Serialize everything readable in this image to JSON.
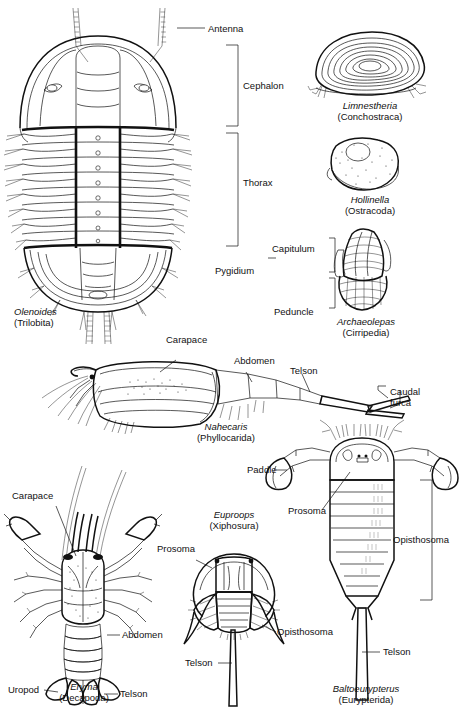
{
  "plate": {
    "title": "Fossil arthropod morphology plate",
    "specimens": [
      {
        "id": "olenoides",
        "genus": "Olenoides",
        "group": "(Trilobita)",
        "labels": [
          "Antenna",
          "Cephalon",
          "Thorax",
          "Pygidium"
        ]
      },
      {
        "id": "limnestheria",
        "genus": "Limnestheria",
        "group": "(Conchostraca)",
        "labels": []
      },
      {
        "id": "hollinella",
        "genus": "Hollinella",
        "group": "(Ostracoda)",
        "labels": []
      },
      {
        "id": "archaeolepas",
        "genus": "Archaeolepas",
        "group": "(Cirripedia)",
        "labels": [
          "Capitulum",
          "Peduncle"
        ]
      },
      {
        "id": "nahecaris",
        "genus": "Nahecaris",
        "group": "(Phyllocarida)",
        "labels": [
          "Carapace",
          "Abdomen",
          "Telson",
          "Caudal",
          "furca"
        ]
      },
      {
        "id": "eryma",
        "genus": "Eryma",
        "group": "(Decapoda)",
        "labels": [
          "Carapace",
          "Abdomen",
          "Uropod",
          "Telson"
        ]
      },
      {
        "id": "euproops",
        "genus": "Euproops",
        "group": "(Xiphosura)",
        "labels": [
          "Prosoma",
          "Opisthosoma",
          "Telson"
        ]
      },
      {
        "id": "baltoeurypterus",
        "genus": "Baltoeurypterus",
        "group": "(Eurypterida)",
        "labels": [
          "Paddle",
          "Prosoma",
          "Opisthosoma",
          "Telson"
        ]
      }
    ]
  },
  "labels": {
    "antenna": "Antenna",
    "cephalon": "Cephalon",
    "thorax": "Thorax",
    "pygidium": "Pygidium",
    "capitulum": "Capitulum",
    "peduncle": "Peduncle",
    "carapace_nahecaris": "Carapace",
    "abdomen_nahecaris": "Abdomen",
    "telson_nahecaris": "Telson",
    "caudal_furca": "Caudal\nfurca",
    "carapace_eryma": "Carapace",
    "abdomen_eryma": "Abdomen",
    "uropod_eryma": "Uropod",
    "telson_eryma": "Telson",
    "prosoma_euproops": "Prosoma",
    "opisthosoma_euproops": "Opisthosoma",
    "telson_euproops": "Telson",
    "paddle_eur": "Paddle",
    "prosoma_eur": "Prosoma",
    "opisthosoma_eur": "Opisthosoma",
    "telson_eur": "Telson"
  },
  "captions": {
    "olenoides_genus": "Olenoides",
    "olenoides_group": "(Trilobita)",
    "limnestheria_genus": "Limnestheria",
    "limnestheria_group": "(Conchostraca)",
    "hollinella_genus": "Hollinella",
    "hollinella_group": "(Ostracoda)",
    "archaeolepas_genus": "Archaeolepas",
    "archaeolepas_group": "(Cirripedia)",
    "nahecaris_genus": "Nahecaris",
    "nahecaris_group": "(Phyllocarida)",
    "eryma_genus": "Eryma",
    "eryma_group": "(Decapoda)",
    "euproops_genus": "Euproops",
    "euproops_group": "(Xiphosura)",
    "baltoeurypterus_genus": "Baltoeurypterus",
    "baltoeurypterus_group": "(Eurypterida)"
  },
  "colors": {
    "ink": "#111111",
    "paper": "#ffffff"
  }
}
